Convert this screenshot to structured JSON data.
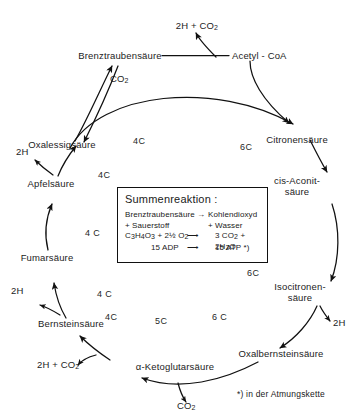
{
  "diagram": {
    "nodes": [
      {
        "id": "brenztraubensaeure",
        "label": "Brenztraubensäure"
      },
      {
        "id": "acetyl_coa",
        "label": "Acetyl - CoA"
      },
      {
        "id": "citronensaeure",
        "label": "Citronensäure"
      },
      {
        "id": "cis_aconitsaeure",
        "label": "cis-Aconit-\nsäure"
      },
      {
        "id": "isocitronensaeure",
        "label": "Isocitronen-\nsäure"
      },
      {
        "id": "oxalbernsteinsaeure",
        "label": "Oxalbernsteinsäure"
      },
      {
        "id": "ketoglutarsaeure",
        "label": "α-Ketoglutarsäure"
      },
      {
        "id": "bernsteinsaeure",
        "label": "Bernsteinsäure"
      },
      {
        "id": "fumarsaeure",
        "label": "Fumarsäure"
      },
      {
        "id": "apfelsaeure",
        "label": "Apfelsäure"
      },
      {
        "id": "oxalessigsaeure",
        "label": "Oxalessigsäure"
      }
    ],
    "byproducts": [
      {
        "id": "top_2h_co2",
        "text": "2H + CO",
        "sub": "2"
      },
      {
        "id": "co2_left",
        "text": "CO",
        "sub": "2"
      },
      {
        "id": "h2_apfel",
        "text": "2H"
      },
      {
        "id": "h2_fumar",
        "text": "2H"
      },
      {
        "id": "h2_bernstein",
        "text": "2H"
      },
      {
        "id": "h2_co2_keto",
        "text": "2H + CO",
        "sub": "2"
      },
      {
        "id": "co2_bottom",
        "text": "CO",
        "sub": "2"
      },
      {
        "id": "h2_isocitro",
        "text": "2H"
      }
    ],
    "carbon_counts": [
      {
        "id": "c-oxal-top",
        "text": "4C"
      },
      {
        "id": "c-citro-top",
        "text": "6C"
      },
      {
        "id": "c-apfel",
        "text": "4C"
      },
      {
        "id": "c-aconit",
        "text": "6C"
      },
      {
        "id": "c-box-left",
        "text": "4 C"
      },
      {
        "id": "c-isocitro",
        "text": "6C"
      },
      {
        "id": "c-fumar",
        "text": "4 C"
      },
      {
        "id": "c-oxalbernstein",
        "text": "6 C"
      },
      {
        "id": "c-bernstein",
        "text": "4C"
      },
      {
        "id": "c-keto",
        "text": "5C"
      }
    ],
    "summary_box": {
      "title": "Summenreaktion :",
      "line1_left": "Brenztraubensäure",
      "line1_arrow": "→",
      "line1_right": "Kohlendioxyd",
      "line2_left": "+ Sauerstoff",
      "line2_right": "+ Wasser",
      "line3_left": "C3H4O3 + 2½ O2",
      "line3_left_html": "C<sub>3</sub>H<sub>4</sub>O<sub>3</sub> + 2½ O<sub>2</sub>",
      "line3_arrow": "⟶",
      "line3_right_html": "3 CO<sub>2</sub> + 2H<sub>2</sub>O",
      "line4_left": "15 ADP",
      "line4_arrow": "⟶",
      "line4_right": "15 ATP *)"
    },
    "footnote": "*) in der Atmungskette"
  }
}
